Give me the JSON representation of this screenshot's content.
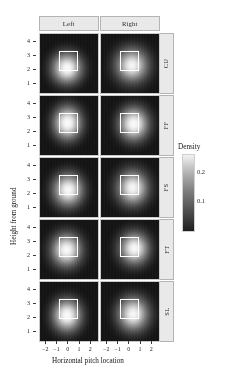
{
  "figure": {
    "x_axis_label": "Horizontal pitch location",
    "y_axis_label": "Height from ground",
    "column_headers": [
      "Left",
      "Right"
    ],
    "row_headers": [
      "CU",
      "FF",
      "FS",
      "FT",
      "SL"
    ],
    "legend_title": "Density",
    "legend_ticks": [
      "0.2",
      "0.1"
    ],
    "x_ticks": [
      "−2",
      "−1",
      "0",
      "1",
      "2"
    ],
    "y_ticks": [
      "4",
      "3",
      "2",
      "1"
    ]
  },
  "chart_data": {
    "type": "heatmap",
    "title": "",
    "subtitle": "",
    "xlabel": "Horizontal pitch location",
    "ylabel": "Height from ground",
    "xlim": [
      -2.6,
      2.6
    ],
    "ylim": [
      0.4,
      4.6
    ],
    "grid": false,
    "legend_position": "right",
    "colorbar": {
      "title": "Density",
      "ticks": [
        0.1,
        0.2
      ],
      "tick_labels": [
        "0.1",
        "0.2"
      ],
      "vmin": 0.0,
      "vmax": 0.26,
      "colormap": "black-to-white (viridis-like greyscale)",
      "low_color": "#1a1a1a",
      "high_color": "#f2f2f2"
    },
    "facets": {
      "rows": [
        "CU",
        "FF",
        "FS",
        "FT",
        "SL"
      ],
      "row_variable": "pitch type",
      "columns": [
        "Left",
        "Right"
      ],
      "column_variable": "batter handedness"
    },
    "strike_zone": {
      "x_min": -0.83,
      "x_max": 0.83,
      "y_min": 1.95,
      "y_max": 3.4,
      "outline_color": "#ffffff"
    },
    "panels": [
      {
        "row": "CU",
        "column": "Left",
        "peak_x": -0.15,
        "peak_y": 2.15,
        "peak_density": 0.24,
        "spread_x": 0.95,
        "spread_y": 0.8
      },
      {
        "row": "CU",
        "column": "Right",
        "peak_x": 0.2,
        "peak_y": 2.35,
        "peak_density": 0.2,
        "spread_x": 1.05,
        "spread_y": 0.9
      },
      {
        "row": "FF",
        "column": "Left",
        "peak_x": -0.1,
        "peak_y": 2.65,
        "peak_density": 0.25,
        "spread_x": 0.9,
        "spread_y": 0.85
      },
      {
        "row": "FF",
        "column": "Right",
        "peak_x": 0.35,
        "peak_y": 2.6,
        "peak_density": 0.24,
        "spread_x": 0.95,
        "spread_y": 0.85
      },
      {
        "row": "FS",
        "column": "Left",
        "peak_x": -0.05,
        "peak_y": 2.3,
        "peak_density": 0.23,
        "spread_x": 0.95,
        "spread_y": 0.85
      },
      {
        "row": "FS",
        "column": "Right",
        "peak_x": 0.25,
        "peak_y": 2.45,
        "peak_density": 0.21,
        "spread_x": 1.0,
        "spread_y": 0.9
      },
      {
        "row": "FT",
        "column": "Left",
        "peak_x": -0.2,
        "peak_y": 2.45,
        "peak_density": 0.23,
        "spread_x": 0.95,
        "spread_y": 0.85
      },
      {
        "row": "FT",
        "column": "Right",
        "peak_x": 0.4,
        "peak_y": 2.55,
        "peak_density": 0.22,
        "spread_x": 0.95,
        "spread_y": 0.85
      },
      {
        "row": "SL",
        "column": "Left",
        "peak_x": -0.15,
        "peak_y": 2.2,
        "peak_density": 0.24,
        "spread_x": 0.9,
        "spread_y": 0.85
      },
      {
        "row": "SL",
        "column": "Right",
        "peak_x": 0.3,
        "peak_y": 2.3,
        "peak_density": 0.21,
        "spread_x": 1.0,
        "spread_y": 0.9
      }
    ]
  }
}
